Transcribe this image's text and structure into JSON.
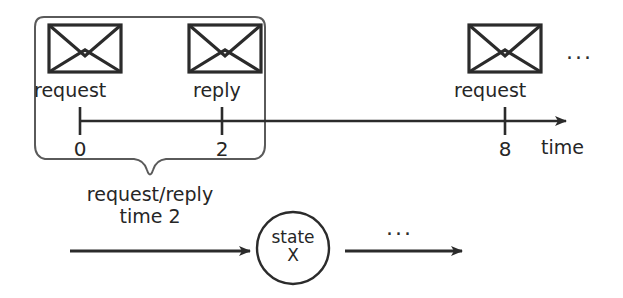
{
  "figure": {
    "kind": "timing-diagram",
    "stroke_color": "#2b2b2b",
    "text_color": "#262626",
    "background": "#ffffff"
  },
  "timeline": {
    "axis_label": "time",
    "ticks": [
      {
        "value": "0",
        "x": 80
      },
      {
        "value": "2",
        "x": 222
      },
      {
        "value": "8",
        "x": 505
      }
    ],
    "messages": [
      {
        "icon": "envelope-icon",
        "label": "request",
        "at_tick": "0"
      },
      {
        "icon": "envelope-icon",
        "label": "reply",
        "at_tick": "2"
      },
      {
        "icon": "envelope-icon",
        "label": "request",
        "at_tick": "8"
      }
    ],
    "continuation": "..."
  },
  "grouping": {
    "brace_label_line1": "request/reply",
    "brace_label_line2": "time 2"
  },
  "state_flow": {
    "node_label_line1": "state",
    "node_label_line2": "X",
    "continuation": "..."
  }
}
